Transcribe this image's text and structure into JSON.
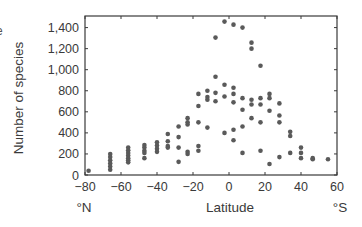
{
  "fragment": "e",
  "chart_data": {
    "type": "scatter",
    "title": "",
    "xlabel": "Latitude",
    "ylabel": "Number of species",
    "x_left_label": "°N",
    "x_right_label": "°S",
    "xlim": [
      -80,
      60
    ],
    "ylim": [
      0,
      1510
    ],
    "xticks": [
      -80,
      -60,
      -40,
      -20,
      0,
      20,
      40,
      60
    ],
    "xtick_labels": [
      "−80",
      "−60",
      "−40",
      "−20",
      "0",
      "20",
      "40",
      "60"
    ],
    "yticks": [
      0,
      200,
      400,
      600,
      800,
      1000,
      1200,
      1400
    ],
    "ytick_labels": [
      "0",
      "200",
      "400",
      "600",
      "800",
      "1,000",
      "1,200",
      "1,400"
    ],
    "grid": false,
    "legend": null,
    "marker_color": "#5a5a5a",
    "points": [
      [
        -78,
        40
      ],
      [
        -66,
        200
      ],
      [
        -66,
        170
      ],
      [
        -66,
        140
      ],
      [
        -66,
        110
      ],
      [
        -66,
        80
      ],
      [
        -66,
        50
      ],
      [
        -56,
        260
      ],
      [
        -56,
        235
      ],
      [
        -56,
        210
      ],
      [
        -56,
        185
      ],
      [
        -56,
        160
      ],
      [
        -56,
        140
      ],
      [
        -56,
        120
      ],
      [
        -47,
        285
      ],
      [
        -47,
        260
      ],
      [
        -47,
        230
      ],
      [
        -47,
        210
      ],
      [
        -47,
        160
      ],
      [
        -40,
        310
      ],
      [
        -40,
        280
      ],
      [
        -40,
        250
      ],
      [
        -40,
        220
      ],
      [
        -34,
        390
      ],
      [
        -34,
        320
      ],
      [
        -34,
        275
      ],
      [
        -34,
        260
      ],
      [
        -28,
        460
      ],
      [
        -28,
        360
      ],
      [
        -28,
        260
      ],
      [
        -28,
        125
      ],
      [
        -23,
        540
      ],
      [
        -23,
        500
      ],
      [
        -23,
        480
      ],
      [
        -23,
        220
      ],
      [
        -23,
        200
      ],
      [
        -17,
        770
      ],
      [
        -17,
        655
      ],
      [
        -17,
        500
      ],
      [
        -17,
        275
      ],
      [
        -17,
        230
      ],
      [
        -12,
        800
      ],
      [
        -12,
        740
      ],
      [
        -12,
        715
      ],
      [
        -12,
        450
      ],
      [
        -7.5,
        1305
      ],
      [
        -7.5,
        933
      ],
      [
        -7.5,
        780
      ],
      [
        -7.5,
        700
      ],
      [
        -2.5,
        1457
      ],
      [
        -2.5,
        857
      ],
      [
        -2.5,
        745
      ],
      [
        -2.5,
        400
      ],
      [
        2.5,
        1428
      ],
      [
        2.5,
        828
      ],
      [
        2.5,
        770
      ],
      [
        2.5,
        690
      ],
      [
        2.5,
        430
      ],
      [
        2.5,
        330
      ],
      [
        7.5,
        1400
      ],
      [
        7.5,
        730
      ],
      [
        7.5,
        620
      ],
      [
        7.5,
        460
      ],
      [
        7.5,
        210
      ],
      [
        12.5,
        1257
      ],
      [
        12.5,
        1200
      ],
      [
        12.5,
        715
      ],
      [
        12.5,
        670
      ],
      [
        12.5,
        540
      ],
      [
        17.5,
        1038
      ],
      [
        17.5,
        730
      ],
      [
        17.5,
        670
      ],
      [
        17.5,
        500
      ],
      [
        17.5,
        230
      ],
      [
        22.5,
        770
      ],
      [
        22.5,
        730
      ],
      [
        22.5,
        610
      ],
      [
        22.5,
        105
      ],
      [
        28,
        680
      ],
      [
        28,
        565
      ],
      [
        28,
        500
      ],
      [
        28,
        170
      ],
      [
        34,
        410
      ],
      [
        34,
        370
      ],
      [
        34,
        210
      ],
      [
        40,
        260
      ],
      [
        40,
        210
      ],
      [
        40,
        160
      ],
      [
        46.5,
        160
      ],
      [
        46.5,
        150
      ],
      [
        55,
        150
      ]
    ]
  }
}
